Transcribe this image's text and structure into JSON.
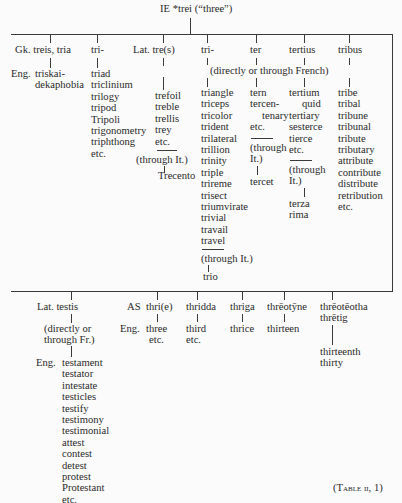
{
  "root": {
    "label": "IE *trei (“three”)"
  },
  "upper": {
    "greek": {
      "source": "Gk. treis, tria",
      "eng_prefix": "Eng.",
      "derivatives": [
        "triskai-",
        "dekaphobia"
      ]
    },
    "greek_tri": {
      "source": "tri-",
      "derivatives": [
        "triad",
        "triclinium",
        "trilogy",
        "tripod",
        "Tripoli",
        "trigonometry",
        "triphthong",
        "etc."
      ]
    },
    "latin_tres": {
      "source": "Lat. tre(s)",
      "derivatives": [
        "trefoil",
        "treble",
        "trellis",
        "trey",
        "etc."
      ],
      "via": "(through It.)",
      "via_derivatives": [
        "Trecento"
      ]
    },
    "french_note": "(directly or through French)",
    "latin_tri": {
      "source": "tri-",
      "derivatives": [
        "triangle",
        "triceps",
        "tricolor",
        "trident",
        "trilateral",
        "trillion",
        "trinity",
        "triple",
        "trireme",
        "trisect",
        "triumvirate",
        "trivial",
        "travail",
        "travel"
      ],
      "via": "(through It.)",
      "via_derivatives": [
        "trio"
      ]
    },
    "ter": {
      "source": "ter",
      "derivatives": [
        "tern",
        "tercen-",
        "tenary",
        "etc."
      ],
      "via": [
        "(through",
        "It.)"
      ],
      "via_derivatives": [
        "tercet"
      ]
    },
    "tertius": {
      "source": "tertius",
      "derivatives": [
        "tertium",
        "quid",
        "tertiary",
        "sesterce",
        "tierce",
        "etc."
      ],
      "via": [
        "(through",
        "It.)"
      ],
      "via_derivatives": [
        "terza",
        "rima"
      ]
    },
    "tribus": {
      "source": "tribus",
      "derivatives": [
        "tribe",
        "tribal",
        "tribune",
        "tribunal",
        "tribute",
        "tributary",
        "attribute",
        "contribute",
        "distribute",
        "retribution",
        "etc."
      ]
    }
  },
  "lower": {
    "testis": {
      "source": "Lat. testis",
      "via": [
        "(directly or",
        "through Fr.)"
      ],
      "eng_prefix": "Eng.",
      "derivatives": [
        "testament",
        "testator",
        "intestate",
        "testicles",
        "testify",
        "testimony",
        "testimonial",
        "attest",
        "contest",
        "detest",
        "protest",
        "Protestant",
        "etc."
      ]
    },
    "as_thrie": {
      "prefix": "AS",
      "source": "thri(e)",
      "eng_prefix": "Eng.",
      "derivatives": [
        "three",
        "etc."
      ]
    },
    "thridda": {
      "source": "thridda",
      "derivatives": [
        "third",
        "etc."
      ]
    },
    "thriga": {
      "source": "thriga",
      "derivatives": [
        "thrice"
      ]
    },
    "threotyne": {
      "source": "thrēotȳne",
      "derivatives": [
        "thirteen"
      ]
    },
    "threoteotha": {
      "source": [
        "thrēotēotha",
        "thrētig"
      ],
      "derivatives": [
        "thirteenth",
        "thirty"
      ]
    }
  },
  "caption": {
    "pre": "(",
    "table_word": "Table",
    "number": " ii, 1)"
  }
}
